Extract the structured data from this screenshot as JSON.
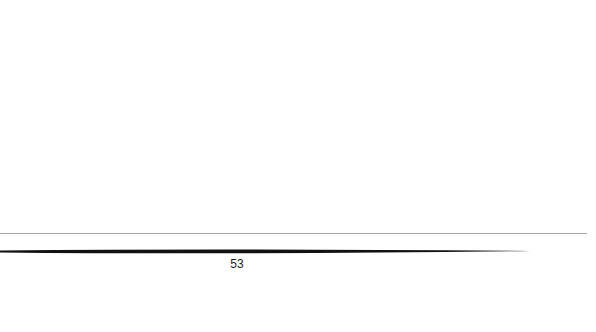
{
  "page": {
    "number": "53",
    "background": "#ffffff",
    "rules": {
      "thin_color": "#a8a8a8",
      "thick_color": "#111111"
    }
  }
}
